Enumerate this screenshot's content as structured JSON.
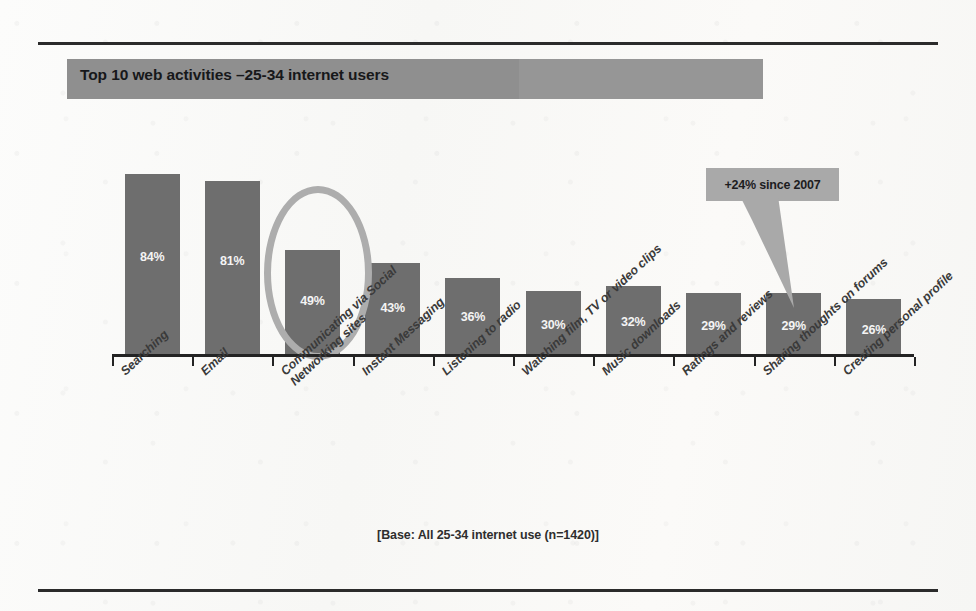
{
  "figure": {
    "title": "Top 10 web activities –25-34 internet users",
    "footer_note": "[Base: All 25-34 internet use (n=1420)]",
    "annotation": "+24% since 2007",
    "colors": {
      "bar_fill": "#6e6e6e",
      "title_band": "#8f8f8f",
      "highlight_ring": "#adadad",
      "callout_fill": "#a9a9a9",
      "axis": "#232323",
      "value_label": "#f4f4f4",
      "category_label": "#3a3a3a",
      "rule": "#2b2b2b",
      "paper": "#fbfbfa"
    }
  },
  "chart_data": {
    "type": "bar",
    "title": "Top 10 web activities –25-34 internet users",
    "xlabel": "",
    "ylabel": "",
    "ylim": [
      0,
      100
    ],
    "grid": false,
    "legend": "none",
    "value_label_suffix": "%",
    "categories": [
      "Searching",
      "Email",
      "Communicating via Social Networking sites",
      "Instant Messaging",
      "Listening to radio",
      "Watching film, TV or video clips",
      "Music downloads",
      "Ratings and reviews",
      "Sharing thoughts on forums",
      "Creating personal profile"
    ],
    "category_lines": [
      [
        "Searching"
      ],
      [
        "Email"
      ],
      [
        "Communicating via Social",
        "Networking sites"
      ],
      [
        "Instant Messaging"
      ],
      [
        "Listening to radio"
      ],
      [
        "Watching film, TV or video clips"
      ],
      [
        "Music downloads"
      ],
      [
        "Ratings and reviews"
      ],
      [
        "Sharing thoughts on forums"
      ],
      [
        "Creating personal profile"
      ]
    ],
    "values": [
      84,
      81,
      49,
      43,
      36,
      30,
      32,
      29,
      29,
      26
    ],
    "value_labels": [
      "84%",
      "81%",
      "49%",
      "43%",
      "36%",
      "30%",
      "32%",
      "29%",
      "29%",
      "26%"
    ],
    "highlighted_category": "Communicating via Social Networking sites",
    "annotations": [
      {
        "text": "+24% since 2007",
        "points_to_category": "Creating personal profile",
        "points_to_value": 26
      }
    ],
    "base_note": "[Base: All 25-34 internet use (n=1420)]"
  }
}
